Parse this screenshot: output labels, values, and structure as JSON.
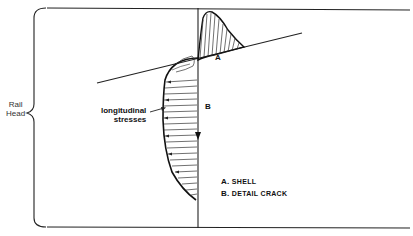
{
  "diagram": {
    "brace_label": [
      "Rail",
      "Head"
    ],
    "annotation": {
      "line1": "longitudinal",
      "line2": "stresses"
    },
    "points": {
      "a": "A",
      "b": "B"
    },
    "legend": [
      {
        "key": "A.",
        "text": "SHELL"
      },
      {
        "key": "B.",
        "text": "DETAIL CRACK"
      }
    ],
    "colors": {
      "ink": "#111111",
      "background": "#ffffff"
    }
  }
}
